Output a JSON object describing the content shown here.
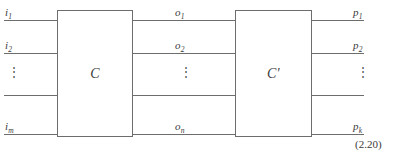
{
  "figure": {
    "equation_number": "(2.20)",
    "gates": [
      {
        "label": "C",
        "name": "gate-c"
      },
      {
        "label": "C′",
        "name": "gate-c-prime"
      }
    ],
    "input_labels": [
      {
        "base": "i",
        "sub": "1"
      },
      {
        "base": "i",
        "sub": "2"
      },
      {
        "base": "i",
        "sub": "m"
      }
    ],
    "middle_labels": [
      {
        "base": "o",
        "sub": "1"
      },
      {
        "base": "o",
        "sub": "2"
      },
      {
        "base": "o",
        "sub": "n"
      }
    ],
    "output_labels": [
      {
        "base": "p",
        "sub": "1"
      },
      {
        "base": "p",
        "sub": "2"
      },
      {
        "base": "p",
        "sub": "k"
      }
    ],
    "ellipsis_glyph": "⋮",
    "colors": {
      "line": "#6d6d6d",
      "text": "#3a3a3a",
      "background": "#ffffff"
    }
  }
}
